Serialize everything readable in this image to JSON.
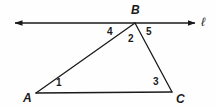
{
  "figure": {
    "type": "geometry-diagram",
    "background_color": "#fefefe",
    "stroke_color": "#1a1a1a",
    "text_color": "#1a1a1a"
  },
  "line": {
    "name": "l",
    "label": "ℓ",
    "label_position": {
      "x": 201,
      "y": 16
    },
    "start": {
      "x": 15,
      "y": 23
    },
    "end": {
      "x": 195,
      "y": 23
    },
    "arrow_start": true,
    "arrow_end": true
  },
  "vertices": [
    {
      "id": "A",
      "label": "A",
      "point": {
        "x": 36,
        "y": 93
      },
      "label_position": {
        "x": 23,
        "y": 92
      }
    },
    {
      "id": "B",
      "label": "B",
      "point": {
        "x": 135,
        "y": 23
      },
      "label_position": {
        "x": 131,
        "y": 4
      }
    },
    {
      "id": "C",
      "label": "C",
      "point": {
        "x": 172,
        "y": 92
      },
      "label_position": {
        "x": 176,
        "y": 93
      }
    }
  ],
  "segments": [
    {
      "id": "AB",
      "from": {
        "x": 36,
        "y": 93
      },
      "to": {
        "x": 135,
        "y": 23
      }
    },
    {
      "id": "BC",
      "from": {
        "x": 135,
        "y": 23
      },
      "to": {
        "x": 172,
        "y": 92
      }
    },
    {
      "id": "AC",
      "from": {
        "x": 36,
        "y": 93
      },
      "to": {
        "x": 172,
        "y": 92
      }
    }
  ],
  "angle_labels": [
    {
      "id": "angle-1",
      "label": "1",
      "at_vertex": "A",
      "position": {
        "x": 56,
        "y": 78
      }
    },
    {
      "id": "angle-2",
      "label": "2",
      "at_vertex": "B",
      "position": {
        "x": 128,
        "y": 34
      }
    },
    {
      "id": "angle-3",
      "label": "3",
      "at_vertex": "C",
      "position": {
        "x": 153,
        "y": 77
      }
    },
    {
      "id": "angle-4",
      "label": "4",
      "at_vertex": "B",
      "position": {
        "x": 107,
        "y": 27
      }
    },
    {
      "id": "angle-5",
      "label": "5",
      "at_vertex": "B",
      "position": {
        "x": 146,
        "y": 27
      }
    }
  ]
}
